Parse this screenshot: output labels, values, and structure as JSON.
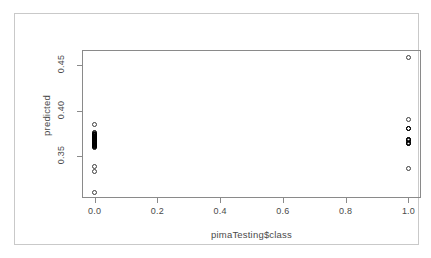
{
  "chart_data": {
    "type": "scatter",
    "title": "",
    "xlabel": "pimaTesting$class",
    "ylabel": "predicted",
    "xlim": [
      -0.04,
      1.04
    ],
    "ylim": [
      0.3045,
      0.4665
    ],
    "grid": false,
    "legend": null,
    "xticks": [
      "0.0",
      "0.2",
      "0.4",
      "0.6",
      "0.8",
      "1.0"
    ],
    "xtick_values": [
      0.0,
      0.2,
      0.4,
      0.6,
      0.8,
      1.0
    ],
    "yticks": [
      "0.35",
      "0.40",
      "0.45"
    ],
    "ytick_values": [
      0.35,
      0.4,
      0.45
    ],
    "marker": "open-circle",
    "marker_color": "#3d3d3d",
    "series": [
      {
        "name": "predicted vs class",
        "points": [
          {
            "x": 0.0,
            "y": 0.3848,
            "weight": 1
          },
          {
            "x": 0.0,
            "y": 0.3757,
            "weight": 2
          },
          {
            "x": 0.0,
            "y": 0.374,
            "weight": 4
          },
          {
            "x": 0.0,
            "y": 0.3722,
            "weight": 6
          },
          {
            "x": 0.0,
            "y": 0.3705,
            "weight": 8
          },
          {
            "x": 0.0,
            "y": 0.3688,
            "weight": 9
          },
          {
            "x": 0.0,
            "y": 0.367,
            "weight": 9
          },
          {
            "x": 0.0,
            "y": 0.3653,
            "weight": 8
          },
          {
            "x": 0.0,
            "y": 0.3636,
            "weight": 6
          },
          {
            "x": 0.0,
            "y": 0.3618,
            "weight": 3
          },
          {
            "x": 0.0,
            "y": 0.3601,
            "weight": 2
          },
          {
            "x": 0.0,
            "y": 0.3385,
            "weight": 1
          },
          {
            "x": 0.0,
            "y": 0.334,
            "weight": 1
          },
          {
            "x": 0.0,
            "y": 0.31,
            "weight": 1
          },
          {
            "x": 1.0,
            "y": 0.458,
            "weight": 1
          },
          {
            "x": 1.0,
            "y": 0.39,
            "weight": 1
          },
          {
            "x": 1.0,
            "y": 0.3805,
            "weight": 2
          },
          {
            "x": 1.0,
            "y": 0.368,
            "weight": 3
          },
          {
            "x": 1.0,
            "y": 0.3645,
            "weight": 3
          },
          {
            "x": 1.0,
            "y": 0.337,
            "weight": 1
          }
        ]
      }
    ]
  },
  "axes": {
    "y_title": "predicted",
    "x_title": "pimaTesting$class",
    "y_tick_labels": [
      "0.35",
      "0.40",
      "0.45"
    ],
    "x_tick_labels": [
      "0.0",
      "0.2",
      "0.4",
      "0.6",
      "0.8",
      "1.0"
    ]
  },
  "colors": {
    "frame": "#c9c9c9",
    "axis": "#8a8a8a",
    "text": "#4a4a4a",
    "marker": "#3d3d3d",
    "marker_dense": "#000000",
    "background": "#ffffff"
  }
}
